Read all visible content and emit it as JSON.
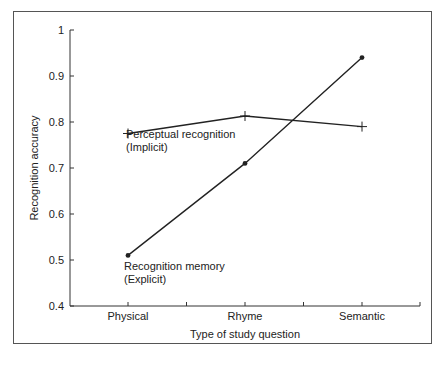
{
  "chart_data": {
    "type": "line",
    "title": "",
    "xlabel": "Type of study question",
    "ylabel": "Recognition accuracy",
    "categories": [
      "Physical",
      "Rhyme",
      "Semantic"
    ],
    "ylim": [
      0.4,
      1.0
    ],
    "yticks": [
      "0.4",
      "0.5",
      "0.6",
      "0.7",
      "0.8",
      "0.9",
      "1"
    ],
    "grid": false,
    "legend": "none (inline annotations)",
    "series": [
      {
        "name": "Perceptual recognition (Implicit)",
        "label_line1": "Perceptual recognition",
        "label_line2": "(Implicit)",
        "marker": "plus",
        "values": [
          0.775,
          0.813,
          0.79
        ]
      },
      {
        "name": "Recognition memory (Explicit)",
        "label_line1": "Recognition memory",
        "label_line2": "(Explicit)",
        "marker": "dot",
        "values": [
          0.51,
          0.71,
          0.94
        ]
      }
    ]
  },
  "colors": {
    "line": "#222222",
    "frame": "#555555",
    "background": "#ffffff"
  }
}
